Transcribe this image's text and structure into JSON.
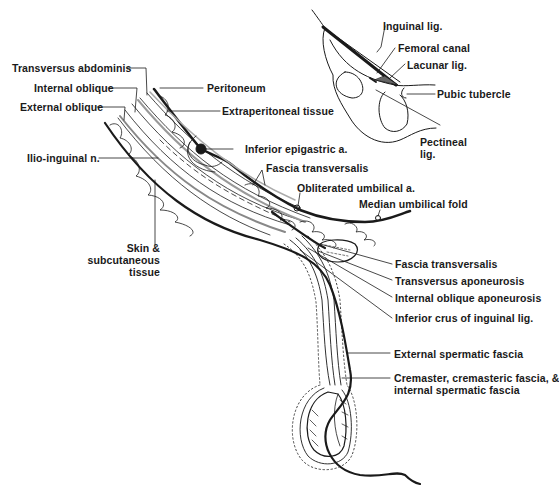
{
  "diagram": {
    "type": "anatomical-cross-section",
    "labels_left": [
      {
        "id": "transversus-abdominis",
        "text": "Transversus abdominis"
      },
      {
        "id": "internal-oblique",
        "text": "Internal oblique"
      },
      {
        "id": "external-oblique",
        "text": "External oblique"
      },
      {
        "id": "ilio-inguinal-n",
        "text": "Ilio-inguinal n."
      },
      {
        "id": "skin-line1",
        "text": "Skin &"
      },
      {
        "id": "skin-line2",
        "text": "subcutaneous"
      },
      {
        "id": "skin-line3",
        "text": "tissue"
      }
    ],
    "labels_right": [
      {
        "id": "peritoneum",
        "text": "Peritoneum"
      },
      {
        "id": "extraperitoneal-tissue",
        "text": "Extraperitoneal tissue"
      },
      {
        "id": "inferior-epigastric-a",
        "text": "Inferior epigastric a."
      },
      {
        "id": "fascia-transversalis-upper",
        "text": "Fascia transversalis"
      },
      {
        "id": "obliterated-umbilical-a",
        "text": "Obliterated umbilical a."
      },
      {
        "id": "median-umbilical-fold",
        "text": "Median umbilical fold"
      },
      {
        "id": "fascia-transversalis-lower",
        "text": "Fascia transversalis"
      },
      {
        "id": "transversus-aponeurosis",
        "text": "Transversus aponeurosis"
      },
      {
        "id": "internal-oblique-aponeurosis",
        "text": "Internal oblique aponeurosis"
      },
      {
        "id": "inferior-crus",
        "text": "Inferior crus of inguinal lig."
      },
      {
        "id": "external-spermatic-fascia",
        "text": "External spermatic fascia"
      },
      {
        "id": "cremaster-line1",
        "text": "Cremaster, cremasteric fascia, &"
      },
      {
        "id": "cremaster-line2",
        "text": "internal spermatic fascia"
      }
    ],
    "inset": {
      "labels": [
        {
          "id": "inguinal-lig",
          "text": "Inguinal lig."
        },
        {
          "id": "femoral-canal",
          "text": "Femoral canal"
        },
        {
          "id": "lacunar-lig",
          "text": "Lacunar lig."
        },
        {
          "id": "pubic-tubercle",
          "text": "Pubic tubercle"
        },
        {
          "id": "pectineal-line1",
          "text": "Pectineal"
        },
        {
          "id": "pectineal-line2",
          "text": "lig."
        }
      ]
    }
  }
}
